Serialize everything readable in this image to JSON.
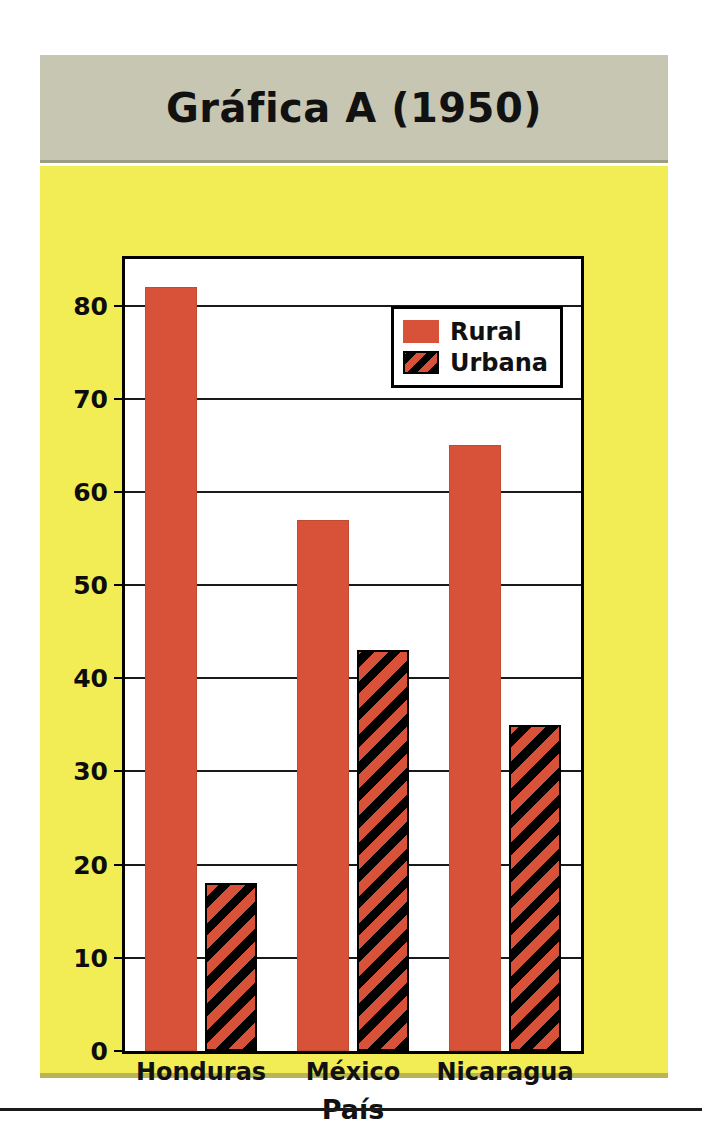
{
  "figure": {
    "title": "Gráfica A (1950)",
    "panel_color": "#f2ed54",
    "title_band_color": "#c7c6b2"
  },
  "chart_data": {
    "type": "bar",
    "title": "Gráfica A (1950)",
    "xlabel": "País",
    "ylabel": "Población (%)",
    "ylabel_main": "Población",
    "ylabel_unit": "(%)",
    "categories": [
      "Honduras",
      "México",
      "Nicaragua"
    ],
    "series": [
      {
        "name": "Rural",
        "color": "#d8523a",
        "pattern": "solid",
        "values": [
          82,
          57,
          65
        ]
      },
      {
        "name": "Urbana",
        "color": "#d8523a",
        "pattern": "diagonal-stripes",
        "values": [
          18,
          43,
          35
        ]
      }
    ],
    "ylim": [
      0,
      85
    ],
    "yticks": [
      0,
      10,
      20,
      30,
      40,
      50,
      60,
      70,
      80
    ],
    "ytick_labels": [
      "0",
      "10",
      "20",
      "30",
      "40",
      "50",
      "60",
      "70",
      "80"
    ],
    "grid": true,
    "grid_axis": "y",
    "legend_position": "top-right",
    "plot_background": "#ffffff"
  }
}
